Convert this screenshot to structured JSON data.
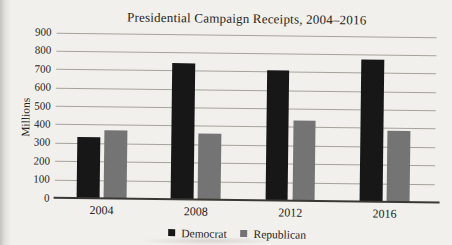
{
  "page": {
    "background_color": "#f2f0ec",
    "gridline_color": "#a6a29b",
    "axis_color": "#3a3834",
    "text_color": "#232323"
  },
  "chart_data": {
    "type": "bar",
    "title": "Presidential Campaign Receipts, 2004–2016",
    "ylabel": "Millions",
    "xlabel": "",
    "categories": [
      "2004",
      "2008",
      "2012",
      "2016"
    ],
    "series": [
      {
        "name": "Democrat",
        "color": "#171717",
        "values": [
          330,
          740,
          705,
          770
        ]
      },
      {
        "name": "Republican",
        "color": "#747474",
        "values": [
          370,
          360,
          435,
          385
        ]
      }
    ],
    "ylim": [
      0,
      900
    ],
    "yticks": [
      0,
      100,
      200,
      300,
      400,
      500,
      600,
      700,
      800,
      900
    ],
    "grid": true,
    "legend_position": "bottom",
    "legend": [
      "Democrat",
      "Republican"
    ]
  }
}
